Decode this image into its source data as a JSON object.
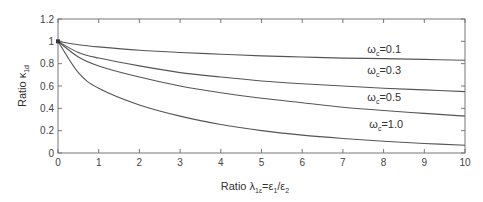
{
  "chart_data": {
    "type": "line",
    "title": "",
    "xlabel": "Ratio λ1ε=ε1/ε2",
    "ylabel": "Ratio κ1d",
    "xlim": [
      0,
      10
    ],
    "ylim": [
      0,
      1.2
    ],
    "xticks": [
      0,
      1,
      2,
      3,
      4,
      5,
      6,
      7,
      8,
      9,
      10
    ],
    "yticks": [
      0,
      0.2,
      0.4,
      0.6,
      0.8,
      1,
      1.2
    ],
    "ytick_labels": [
      "0",
      "0.2",
      "0.4",
      "0.6",
      "0.8",
      "1",
      "1.2"
    ],
    "grid": false,
    "legend_position": "inline annotations near right end of curves",
    "x": [
      0,
      0.5,
      1,
      2,
      3,
      4,
      5,
      6,
      7,
      8,
      9,
      10
    ],
    "series": [
      {
        "name": "ωc=0.1",
        "label_main": "ω",
        "label_sub": "c",
        "label_rest": "=0.1",
        "label_x": 7.6,
        "label_y": 0.9,
        "values": [
          1.0,
          0.97,
          0.95,
          0.92,
          0.9,
          0.885,
          0.87,
          0.86,
          0.85,
          0.845,
          0.838,
          0.83
        ]
      },
      {
        "name": "ωc=0.3",
        "label_main": "ω",
        "label_sub": "c",
        "label_rest": "=0.3",
        "label_x": 7.6,
        "label_y": 0.71,
        "values": [
          1.0,
          0.9,
          0.85,
          0.78,
          0.72,
          0.68,
          0.645,
          0.62,
          0.6,
          0.58,
          0.565,
          0.55
        ]
      },
      {
        "name": "ωc=0.5",
        "label_main": "ω",
        "label_sub": "c",
        "label_rest": "=0.5",
        "label_x": 7.6,
        "label_y": 0.465,
        "values": [
          1.0,
          0.86,
          0.78,
          0.68,
          0.6,
          0.54,
          0.49,
          0.45,
          0.41,
          0.38,
          0.355,
          0.33
        ]
      },
      {
        "name": "ωc=1.0",
        "label_main": "ω",
        "label_sub": "c",
        "label_rest": "=1.0",
        "label_x": 7.65,
        "label_y": 0.22,
        "values": [
          1.0,
          0.72,
          0.58,
          0.43,
          0.33,
          0.255,
          0.2,
          0.16,
          0.13,
          0.105,
          0.085,
          0.07
        ]
      }
    ]
  },
  "labels": {
    "xlabel_prefix": "Ratio λ",
    "xlabel_sub1": "1ε",
    "xlabel_mid": "=ε",
    "xlabel_sub2": "1",
    "xlabel_slash": "/ε",
    "xlabel_sub3": "2",
    "ylabel_prefix": "Ratio κ",
    "ylabel_sub": "1d"
  },
  "colors": {
    "line": "#555555",
    "axis": "#777777"
  }
}
